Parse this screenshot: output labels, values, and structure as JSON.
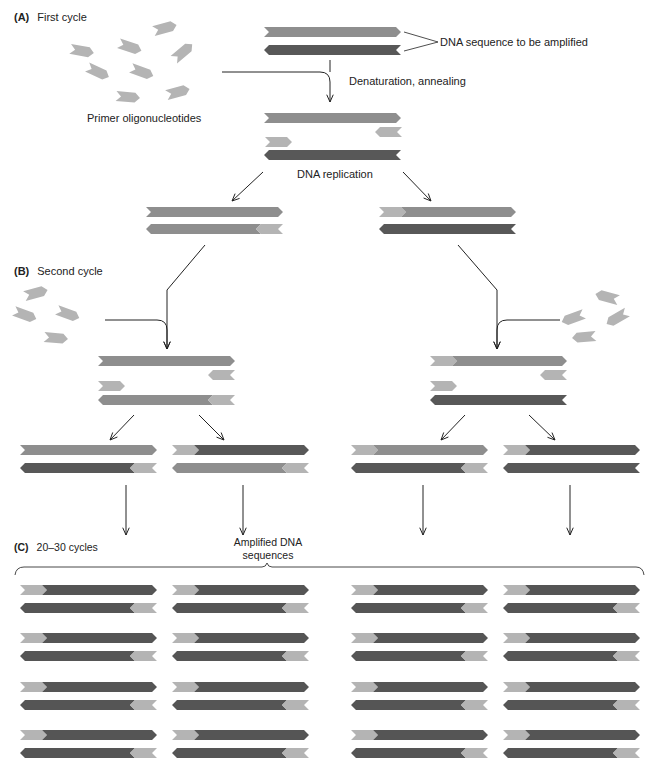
{
  "colors": {
    "primer": "#b4b4b4",
    "template_top": "#8e8e8e",
    "template_bottom": "#585858",
    "amplified": "#555555",
    "line": "#222222"
  },
  "sections": {
    "a": {
      "letter": "(A)",
      "title": "First cycle"
    },
    "b": {
      "letter": "(B)",
      "title": "Second cycle"
    },
    "c": {
      "letter": "(C)",
      "title": "20–30 cycles"
    }
  },
  "labels": {
    "dna_target": "DNA sequence to be amplified",
    "denaturation": "Denaturation, annealing",
    "primers": "Primer oligonucleotides",
    "replication": "DNA replication",
    "amplified_line1": "Amplified DNA",
    "amplified_line2": "sequences"
  },
  "strand_width": 137,
  "strand_height": 10,
  "primer_width": 27,
  "strands": [
    {
      "x": 264,
      "y": 27,
      "dir": "right",
      "color": "template_top"
    },
    {
      "x": 264,
      "y": 45,
      "dir": "left",
      "color": "template_bottom"
    },
    {
      "x": 264,
      "y": 113,
      "dir": "right",
      "color": "template_top"
    },
    {
      "x": 375,
      "y": 127,
      "dir": "left",
      "color": "primer",
      "w": 27
    },
    {
      "x": 265,
      "y": 137,
      "dir": "right",
      "color": "primer",
      "w": 27
    },
    {
      "x": 264,
      "y": 150,
      "dir": "left",
      "color": "template_bottom"
    },
    {
      "x": 146,
      "y": 207,
      "dir": "right",
      "color": "template_top"
    },
    {
      "x": 146,
      "y": 224,
      "dir": "left",
      "color": "template_top",
      "primer": "right"
    },
    {
      "x": 379,
      "y": 207,
      "dir": "right",
      "color": "template_top",
      "primer": "left"
    },
    {
      "x": 379,
      "y": 224,
      "dir": "left",
      "color": "template_bottom"
    },
    {
      "x": 98,
      "y": 356,
      "dir": "right",
      "color": "template_top"
    },
    {
      "x": 208,
      "y": 370,
      "dir": "left",
      "color": "primer",
      "w": 27
    },
    {
      "x": 98,
      "y": 381,
      "dir": "right",
      "color": "primer",
      "w": 27
    },
    {
      "x": 98,
      "y": 395,
      "dir": "left",
      "color": "template_top",
      "primer": "right"
    },
    {
      "x": 430,
      "y": 356,
      "dir": "right",
      "color": "template_top",
      "primer": "left"
    },
    {
      "x": 540,
      "y": 370,
      "dir": "left",
      "color": "primer",
      "w": 27
    },
    {
      "x": 430,
      "y": 381,
      "dir": "right",
      "color": "primer",
      "w": 27
    },
    {
      "x": 430,
      "y": 395,
      "dir": "left",
      "color": "template_bottom"
    },
    {
      "x": 20,
      "y": 445,
      "dir": "right",
      "color": "template_top"
    },
    {
      "x": 20,
      "y": 463,
      "dir": "left",
      "color": "template_bottom",
      "primer": "right"
    },
    {
      "x": 172,
      "y": 445,
      "dir": "right",
      "color": "template_bottom",
      "primer": "left"
    },
    {
      "x": 172,
      "y": 463,
      "dir": "left",
      "color": "template_top",
      "primer": "right"
    },
    {
      "x": 351,
      "y": 445,
      "dir": "right",
      "color": "template_top",
      "primer": "left"
    },
    {
      "x": 351,
      "y": 463,
      "dir": "left",
      "color": "template_bottom",
      "primer": "right"
    },
    {
      "x": 503,
      "y": 445,
      "dir": "right",
      "color": "template_bottom",
      "primer": "left"
    },
    {
      "x": 503,
      "y": 463,
      "dir": "left",
      "color": "template_bottom"
    }
  ],
  "free_primers": [
    {
      "x": 165,
      "y": 28,
      "rot": -15
    },
    {
      "x": 82,
      "y": 51,
      "rot": 10
    },
    {
      "x": 130,
      "y": 47,
      "rot": 18
    },
    {
      "x": 183,
      "y": 52,
      "rot": -40
    },
    {
      "x": 98,
      "y": 72,
      "rot": 25
    },
    {
      "x": 142,
      "y": 72,
      "rot": 20
    },
    {
      "x": 178,
      "y": 92,
      "rot": -15
    },
    {
      "x": 128,
      "y": 97,
      "rot": 5
    },
    {
      "x": 36,
      "y": 293,
      "rot": -15
    },
    {
      "x": 25,
      "y": 315,
      "rot": 20
    },
    {
      "x": 68,
      "y": 314,
      "rot": 20
    },
    {
      "x": 56,
      "y": 338,
      "rot": 5
    },
    {
      "x": 607,
      "y": 297,
      "dir": "left",
      "rot": 15
    },
    {
      "x": 573,
      "y": 318,
      "dir": "left",
      "rot": -20
    },
    {
      "x": 617,
      "y": 318,
      "dir": "left",
      "rot": -30
    },
    {
      "x": 584,
      "y": 337,
      "dir": "left",
      "rot": -5
    }
  ],
  "amplified": {
    "columns_x": [
      20,
      172,
      351,
      503
    ],
    "rows_y": [
      585,
      633,
      682,
      730
    ],
    "pair_gap": 18
  },
  "arrows": [
    {
      "type": "merge",
      "from": [
        222,
        72
      ],
      "corner": [
        330,
        72
      ],
      "to": [
        330,
        102
      ]
    },
    {
      "type": "straight",
      "from": [
        263,
        172
      ],
      "to": [
        232,
        201
      ]
    },
    {
      "type": "straight",
      "from": [
        403,
        172
      ],
      "to": [
        431,
        201
      ]
    },
    {
      "type": "bend",
      "points": [
        [
          205,
          245
        ],
        [
          167,
          290
        ],
        [
          167,
          349
        ]
      ]
    },
    {
      "type": "merge",
      "from": [
        105,
        320
      ],
      "corner": [
        167,
        320
      ],
      "to": [
        167,
        349
      ]
    },
    {
      "type": "bend",
      "points": [
        [
          458,
          245
        ],
        [
          497,
          290
        ],
        [
          497,
          349
        ]
      ]
    },
    {
      "type": "merge",
      "from": [
        560,
        320
      ],
      "corner": [
        497,
        320
      ],
      "to": [
        497,
        349
      ]
    },
    {
      "type": "straight",
      "from": [
        134,
        415
      ],
      "to": [
        110,
        440
      ]
    },
    {
      "type": "straight",
      "from": [
        199,
        415
      ],
      "to": [
        224,
        440
      ]
    },
    {
      "type": "straight",
      "from": [
        465,
        415
      ],
      "to": [
        441,
        440
      ]
    },
    {
      "type": "straight",
      "from": [
        529,
        415
      ],
      "to": [
        555,
        440
      ]
    },
    {
      "type": "straight",
      "from": [
        126,
        485
      ],
      "to": [
        126,
        535
      ]
    },
    {
      "type": "straight",
      "from": [
        243,
        485
      ],
      "to": [
        243,
        535
      ]
    },
    {
      "type": "straight",
      "from": [
        423,
        485
      ],
      "to": [
        423,
        535
      ]
    },
    {
      "type": "straight",
      "from": [
        570,
        485
      ],
      "to": [
        570,
        535
      ]
    }
  ]
}
